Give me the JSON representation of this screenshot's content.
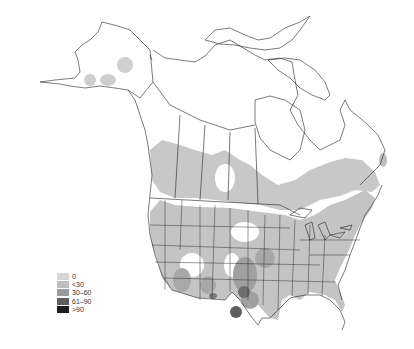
{
  "map": {
    "region": "North America (Alaska, Canada, contiguous United States)",
    "style": "grayscale choropleth with state/province boundaries",
    "shading_colors": {
      "zero": "#d6d6d6",
      "lt30": "#bdbdbd",
      "30_60": "#9a9a9a",
      "61_90": "#5e5e5e",
      "gt90": "#1e1e1e"
    }
  },
  "legend": {
    "items": [
      {
        "label": "0",
        "color": "#d6d6d6"
      },
      {
        "label": "<30",
        "color": "#bdbdbd"
      },
      {
        "label": "30–60",
        "color": "#9a9a9a"
      },
      {
        "label": "61–90",
        "color": "#5e5e5e"
      },
      {
        "label": ">90",
        "color": "#1e1e1e"
      }
    ]
  }
}
